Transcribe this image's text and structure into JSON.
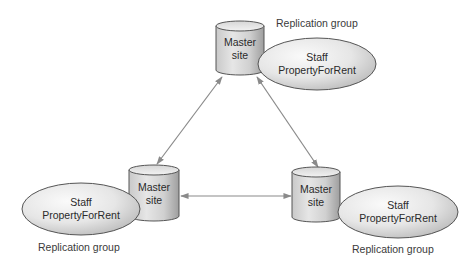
{
  "diagram": {
    "type": "replication-topology",
    "nodes": [
      {
        "id": "top",
        "site_label": [
          "Master",
          "site"
        ],
        "data_label": [
          "Staff",
          "PropertyForRent"
        ],
        "group_label": "Replication group"
      },
      {
        "id": "bottom-left",
        "site_label": [
          "Master",
          "site"
        ],
        "data_label": [
          "Staff",
          "PropertyForRent"
        ],
        "group_label": "Replication group"
      },
      {
        "id": "bottom-right",
        "site_label": [
          "Master",
          "site"
        ],
        "data_label": [
          "Staff",
          "PropertyForRent"
        ],
        "group_label": "Replication group"
      }
    ],
    "edges": [
      {
        "from": "top",
        "to": "bottom-left",
        "bidirectional": true
      },
      {
        "from": "top",
        "to": "bottom-right",
        "bidirectional": true
      },
      {
        "from": "bottom-left",
        "to": "bottom-right",
        "bidirectional": true
      }
    ],
    "colors": {
      "stroke": "#555555",
      "arrow": "#8a8a8a",
      "cylinder_light": "#e8e8e8",
      "cylinder_dark": "#a9a9a9",
      "ellipse_light": "#f4f4f4",
      "ellipse_dark": "#bdbdbd"
    }
  }
}
